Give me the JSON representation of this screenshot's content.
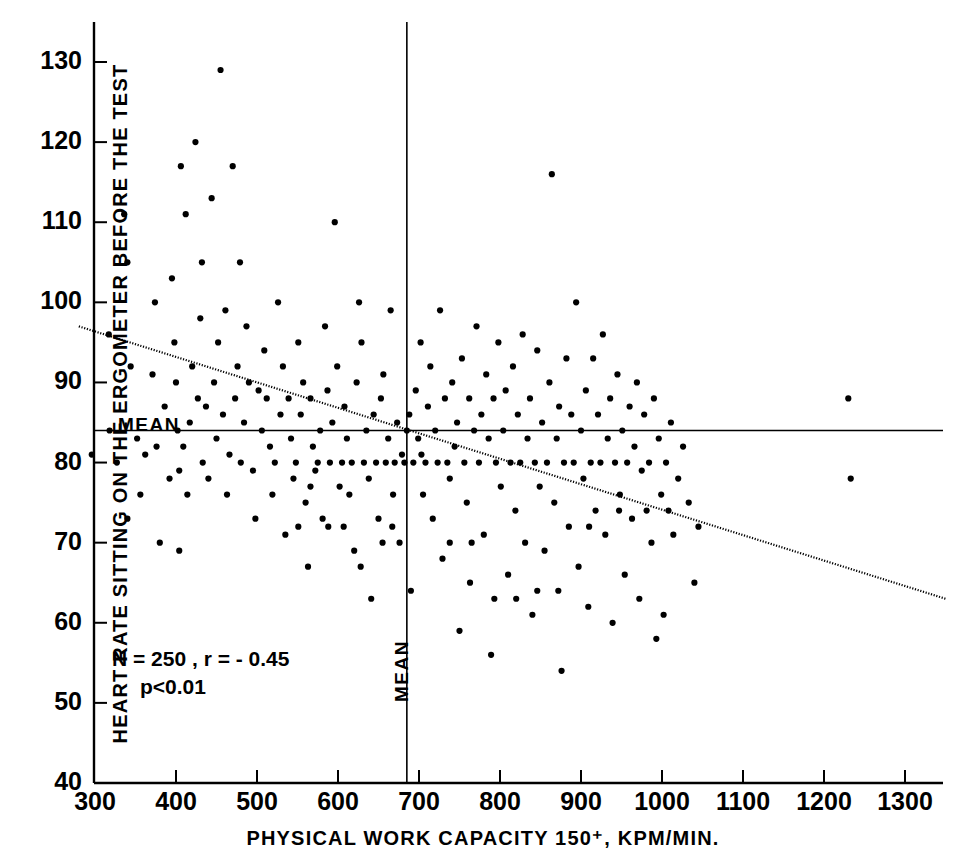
{
  "figure": {
    "background_color": "#ffffff",
    "ink_color": "#000000"
  },
  "labels": {
    "y_axis_title": "HEART RATE SITTING ON THE ERGOMETER  BEFORE THE TEST",
    "x_axis_title": "PHYSICAL WORK CAPACITY 150⁺, KPM/MIN.",
    "mean_horizontal": "MEAN",
    "mean_vertical": "MEAN",
    "stats_line_1": "N = 250 , r = - 0.45",
    "stats_line_2": "p<0.01"
  },
  "chart_data": {
    "type": "scatter",
    "title": "",
    "subtitle": "",
    "xlabel": "PHYSICAL WORK CAPACITY 150⁺, KPM/MIN.",
    "ylabel": "HEART RATE SITTING ON THE ERGOMETER BEFORE THE TEST",
    "xlim": [
      280,
      1350
    ],
    "ylim": [
      40,
      133
    ],
    "xticks": [
      300,
      400,
      500,
      600,
      700,
      800,
      900,
      1000,
      1100,
      1200,
      1300
    ],
    "yticks": [
      40,
      50,
      60,
      70,
      80,
      90,
      100,
      110,
      120,
      130
    ],
    "xtick_labels": [
      "300",
      "400",
      "500",
      "600",
      "700",
      "800",
      "900",
      "1000",
      "1100",
      "1200",
      "1300"
    ],
    "ytick_labels": [
      "40",
      "50",
      "60",
      "70",
      "80",
      "90",
      "100",
      "110",
      "120",
      "130"
    ],
    "grid": false,
    "legend": null,
    "legend_position": "none",
    "statistics": {
      "n": 250,
      "r": -0.45,
      "p": "<0.01"
    },
    "annotations": [
      {
        "text": "N = 250 , r = - 0.45",
        "x": 330,
        "y": 57
      },
      {
        "text": "p<0.01",
        "x": 360,
        "y": 53.5
      },
      {
        "text": "MEAN",
        "x": 310,
        "y": 85.5,
        "kind": "horizontal-mean-label"
      },
      {
        "text": "MEAN",
        "x": 685,
        "y": 48,
        "kind": "vertical-mean-label"
      }
    ],
    "reference_lines": [
      {
        "name": "mean-heart-rate",
        "orientation": "horizontal",
        "value": 84,
        "label": "MEAN"
      },
      {
        "name": "mean-work-capacity",
        "orientation": "vertical",
        "value": 685,
        "label": "MEAN"
      }
    ],
    "regression_line": {
      "style": "dotted",
      "x_start": 280,
      "y_start": 97,
      "x_end": 1350,
      "y_end": 63,
      "slope": -0.0318,
      "intercept": 105.9
    },
    "series": [
      {
        "name": "subjects",
        "marker": "dot",
        "color": "#000000",
        "points": [
          [
            283,
            102
          ],
          [
            285,
            97
          ],
          [
            290,
            85
          ],
          [
            296,
            81
          ],
          [
            317,
            96
          ],
          [
            318,
            84
          ],
          [
            327,
            80
          ],
          [
            336,
            111
          ],
          [
            340,
            105
          ],
          [
            344,
            92
          ],
          [
            352,
            83
          ],
          [
            356,
            76
          ],
          [
            362,
            81
          ],
          [
            371,
            91
          ],
          [
            374,
            100
          ],
          [
            376,
            82
          ],
          [
            380,
            70
          ],
          [
            386,
            87
          ],
          [
            392,
            78
          ],
          [
            395,
            103
          ],
          [
            398,
            95
          ],
          [
            400,
            90
          ],
          [
            402,
            84
          ],
          [
            404,
            79
          ],
          [
            406,
            117
          ],
          [
            409,
            82
          ],
          [
            412,
            111
          ],
          [
            414,
            76
          ],
          [
            417,
            85
          ],
          [
            420,
            92
          ],
          [
            424,
            120
          ],
          [
            427,
            88
          ],
          [
            430,
            98
          ],
          [
            433,
            80
          ],
          [
            437,
            87
          ],
          [
            440,
            78
          ],
          [
            444,
            113
          ],
          [
            447,
            90
          ],
          [
            450,
            83
          ],
          [
            452,
            95
          ],
          [
            455,
            129
          ],
          [
            458,
            86
          ],
          [
            461,
            99
          ],
          [
            463,
            76
          ],
          [
            466,
            81
          ],
          [
            470,
            117
          ],
          [
            473,
            88
          ],
          [
            476,
            92
          ],
          [
            480,
            80
          ],
          [
            484,
            85
          ],
          [
            487,
            97
          ],
          [
            490,
            90
          ],
          [
            495,
            79
          ],
          [
            498,
            73
          ],
          [
            502,
            89
          ],
          [
            506,
            84
          ],
          [
            509,
            94
          ],
          [
            512,
            88
          ],
          [
            516,
            82
          ],
          [
            519,
            76
          ],
          [
            522,
            80
          ],
          [
            526,
            100
          ],
          [
            529,
            86
          ],
          [
            532,
            92
          ],
          [
            535,
            71
          ],
          [
            539,
            88
          ],
          [
            542,
            83
          ],
          [
            545,
            78
          ],
          [
            548,
            80
          ],
          [
            551,
            95
          ],
          [
            554,
            86
          ],
          [
            557,
            90
          ],
          [
            560,
            75
          ],
          [
            563,
            67
          ],
          [
            566,
            88
          ],
          [
            569,
            82
          ],
          [
            572,
            79
          ],
          [
            575,
            80
          ],
          [
            578,
            84
          ],
          [
            581,
            73
          ],
          [
            584,
            97
          ],
          [
            587,
            89
          ],
          [
            590,
            80
          ],
          [
            593,
            85
          ],
          [
            596,
            110
          ],
          [
            599,
            92
          ],
          [
            602,
            77
          ],
          [
            605,
            80
          ],
          [
            608,
            87
          ],
          [
            611,
            83
          ],
          [
            614,
            76
          ],
          [
            617,
            80
          ],
          [
            620,
            69
          ],
          [
            623,
            90
          ],
          [
            626,
            100
          ],
          [
            629,
            95
          ],
          [
            632,
            80
          ],
          [
            635,
            84
          ],
          [
            638,
            78
          ],
          [
            641,
            63
          ],
          [
            644,
            86
          ],
          [
            647,
            80
          ],
          [
            650,
            73
          ],
          [
            653,
            88
          ],
          [
            656,
            91
          ],
          [
            659,
            80
          ],
          [
            662,
            83
          ],
          [
            665,
            99
          ],
          [
            668,
            76
          ],
          [
            670,
            80
          ],
          [
            673,
            85
          ],
          [
            676,
            70
          ],
          [
            679,
            81
          ],
          [
            682,
            80
          ],
          [
            685,
            84
          ],
          [
            688,
            86
          ],
          [
            690,
            64
          ],
          [
            693,
            80
          ],
          [
            696,
            89
          ],
          [
            699,
            83
          ],
          [
            702,
            95
          ],
          [
            705,
            76
          ],
          [
            708,
            80
          ],
          [
            711,
            87
          ],
          [
            714,
            92
          ],
          [
            717,
            73
          ],
          [
            720,
            84
          ],
          [
            723,
            80
          ],
          [
            726,
            99
          ],
          [
            729,
            68
          ],
          [
            732,
            88
          ],
          [
            735,
            80
          ],
          [
            738,
            78
          ],
          [
            741,
            90
          ],
          [
            744,
            82
          ],
          [
            747,
            85
          ],
          [
            750,
            59
          ],
          [
            753,
            93
          ],
          [
            756,
            80
          ],
          [
            759,
            75
          ],
          [
            762,
            88
          ],
          [
            765,
            70
          ],
          [
            768,
            84
          ],
          [
            771,
            97
          ],
          [
            774,
            80
          ],
          [
            777,
            86
          ],
          [
            780,
            71
          ],
          [
            783,
            91
          ],
          [
            786,
            83
          ],
          [
            789,
            56
          ],
          [
            792,
            88
          ],
          [
            795,
            80
          ],
          [
            798,
            95
          ],
          [
            801,
            77
          ],
          [
            804,
            84
          ],
          [
            807,
            89
          ],
          [
            810,
            66
          ],
          [
            813,
            80
          ],
          [
            816,
            92
          ],
          [
            819,
            74
          ],
          [
            822,
            86
          ],
          [
            825,
            80
          ],
          [
            828,
            96
          ],
          [
            831,
            70
          ],
          [
            834,
            83
          ],
          [
            837,
            88
          ],
          [
            840,
            61
          ],
          [
            843,
            80
          ],
          [
            846,
            94
          ],
          [
            849,
            77
          ],
          [
            852,
            85
          ],
          [
            855,
            69
          ],
          [
            858,
            80
          ],
          [
            861,
            90
          ],
          [
            864,
            116
          ],
          [
            867,
            75
          ],
          [
            870,
            83
          ],
          [
            873,
            87
          ],
          [
            876,
            54
          ],
          [
            879,
            80
          ],
          [
            882,
            93
          ],
          [
            885,
            72
          ],
          [
            888,
            86
          ],
          [
            891,
            80
          ],
          [
            894,
            100
          ],
          [
            897,
            67
          ],
          [
            900,
            84
          ],
          [
            903,
            78
          ],
          [
            906,
            89
          ],
          [
            909,
            62
          ],
          [
            912,
            80
          ],
          [
            915,
            93
          ],
          [
            918,
            74
          ],
          [
            921,
            86
          ],
          [
            924,
            80
          ],
          [
            927,
            96
          ],
          [
            930,
            71
          ],
          [
            933,
            83
          ],
          [
            936,
            88
          ],
          [
            939,
            60
          ],
          [
            942,
            80
          ],
          [
            945,
            91
          ],
          [
            948,
            76
          ],
          [
            951,
            84
          ],
          [
            954,
            66
          ],
          [
            957,
            80
          ],
          [
            960,
            87
          ],
          [
            963,
            73
          ],
          [
            966,
            82
          ],
          [
            969,
            90
          ],
          [
            972,
            63
          ],
          [
            975,
            79
          ],
          [
            978,
            86
          ],
          [
            981,
            74
          ],
          [
            984,
            80
          ],
          [
            987,
            70
          ],
          [
            990,
            88
          ],
          [
            993,
            58
          ],
          [
            996,
            83
          ],
          [
            999,
            76
          ],
          [
            1002,
            61
          ],
          [
            1005,
            80
          ],
          [
            1008,
            74
          ],
          [
            1011,
            85
          ],
          [
            1014,
            71
          ],
          [
            1020,
            78
          ],
          [
            1026,
            82
          ],
          [
            1033,
            75
          ],
          [
            1040,
            65
          ],
          [
            1045,
            72
          ],
          [
            1230,
            88
          ],
          [
            1233,
            78
          ],
          [
            340,
            73
          ],
          [
            404,
            69
          ],
          [
            432,
            105
          ],
          [
            479,
            105
          ],
          [
            551,
            72
          ],
          [
            566,
            77
          ],
          [
            588,
            72
          ],
          [
            607,
            72
          ],
          [
            628,
            67
          ],
          [
            655,
            70
          ],
          [
            667,
            72
          ],
          [
            703,
            81
          ],
          [
            738,
            70
          ],
          [
            763,
            65
          ],
          [
            793,
            63
          ],
          [
            820,
            63
          ],
          [
            846,
            64
          ],
          [
            872,
            64
          ],
          [
            910,
            72
          ],
          [
            947,
            74
          ]
        ]
      }
    ]
  }
}
